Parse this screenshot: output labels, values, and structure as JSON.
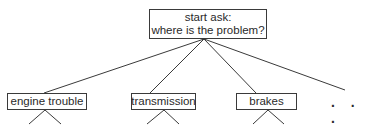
{
  "diagram": {
    "type": "tree",
    "root": {
      "line1": "start ask:",
      "line2": "where is the problem?"
    },
    "children": [
      {
        "label": "engine trouble",
        "has_subtree": true
      },
      {
        "label": "transmission",
        "has_subtree": true
      },
      {
        "label": "brakes",
        "has_subtree": true
      }
    ],
    "more_indicator": ". . .",
    "colors": {
      "line": "#3a3a3a",
      "box_border": "#3a3a3a",
      "text": "#2a2a2a",
      "background": "#ffffff"
    }
  }
}
